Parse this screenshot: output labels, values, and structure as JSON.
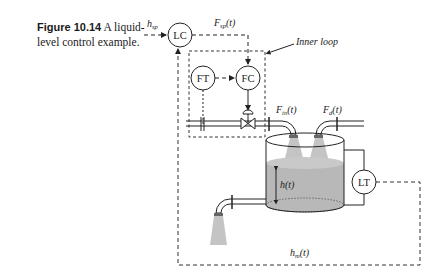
{
  "caption": {
    "figure_label": "Figure 10.14",
    "text": "A liquid-level control example."
  },
  "nodes": {
    "lc": "LC",
    "ft": "FT",
    "fc": "FC",
    "lt": "LT"
  },
  "labels": {
    "h_sp": {
      "main": "h",
      "sub": "sp"
    },
    "F_sp": {
      "main": "F",
      "sub": "sp",
      "arg": "(t)"
    },
    "F_in": {
      "main": "F",
      "sub": "in",
      "arg": "(t)"
    },
    "F_d": {
      "main": "F",
      "sub": "d",
      "arg": "(t)"
    },
    "h_t": {
      "main": "h",
      "arg": "(t)"
    },
    "h_m": {
      "main": "h",
      "sub": "m",
      "arg": "(t)"
    },
    "inner_loop": "Inner loop"
  },
  "colors": {
    "line": "#222222",
    "liquid": "#b8b8b8",
    "spray": "#c4c4c4",
    "dash": "#333333"
  }
}
